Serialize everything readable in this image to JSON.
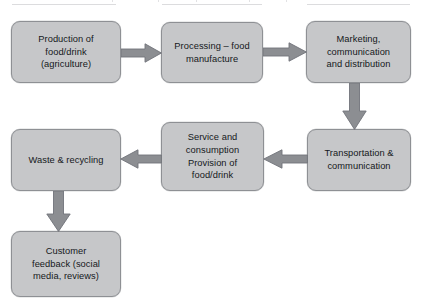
{
  "diagram": {
    "type": "flowchart",
    "title": "",
    "background_color": "#ffffff",
    "node_fill_color": "#c6c7c9",
    "node_border_color": "#8e9094",
    "arrow_color": "#8c8e92",
    "text_color": "#15181b",
    "nodes": [
      {
        "id": "production",
        "label": "Production of\nfood/drink\n(agriculture)"
      },
      {
        "id": "processing",
        "label": "Processing – food\nmanufacture"
      },
      {
        "id": "marketing",
        "label": "Marketing,\ncommunication\nand distribution"
      },
      {
        "id": "transport",
        "label": "Transportation &\ncommunication"
      },
      {
        "id": "service",
        "label": "Service and\nconsumption\nProvision of\nfood/drink"
      },
      {
        "id": "waste",
        "label": "Waste & recycling"
      },
      {
        "id": "feedback",
        "label": "Customer\nfeedback (social\nmedia, reviews)"
      }
    ],
    "edges": [
      {
        "id": "prod-proc",
        "from": "production",
        "to": "processing",
        "direction": "right"
      },
      {
        "id": "proc-mark",
        "from": "processing",
        "to": "marketing",
        "direction": "right"
      },
      {
        "id": "mark-trans",
        "from": "marketing",
        "to": "transport",
        "direction": "down"
      },
      {
        "id": "trans-serv",
        "from": "transport",
        "to": "service",
        "direction": "left"
      },
      {
        "id": "serv-waste",
        "from": "service",
        "to": "waste",
        "direction": "left"
      },
      {
        "id": "waste-feed",
        "from": "waste",
        "to": "feedback",
        "direction": "down"
      }
    ]
  }
}
